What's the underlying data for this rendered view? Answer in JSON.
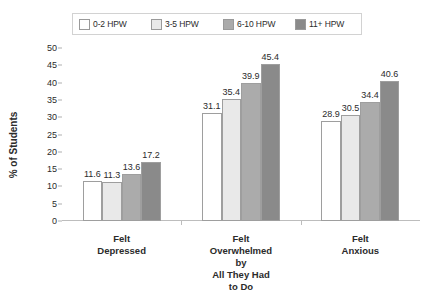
{
  "chart_data": {
    "type": "bar",
    "title": "",
    "xlabel": "",
    "ylabel": "% of Students",
    "ylim": [
      0,
      50
    ],
    "yticks": [
      0,
      5,
      10,
      15,
      20,
      25,
      30,
      35,
      40,
      45,
      50
    ],
    "grid": false,
    "legend_position": "top",
    "categories": [
      "Felt Depressed",
      "Felt Overwhelmed by\nAll They Had to Do",
      "Felt Anxious"
    ],
    "series": [
      {
        "name": "0-2 HPW",
        "color": "#ffffff",
        "values": [
          11.6,
          31.1,
          28.9
        ]
      },
      {
        "name": "3-5 HPW",
        "color": "#e9e9e9",
        "values": [
          11.3,
          35.4,
          30.5
        ]
      },
      {
        "name": "6-10 HPW",
        "color": "#ababab",
        "values": [
          13.6,
          39.9,
          34.4
        ]
      },
      {
        "name": "11+ HPW",
        "color": "#8a8a8a",
        "values": [
          17.2,
          45.4,
          40.6
        ]
      }
    ],
    "value_labels": [
      [
        "11.6",
        "11.3",
        "13.6",
        "17.2"
      ],
      [
        "31.1",
        "35.4",
        "39.9",
        "45.4"
      ],
      [
        "28.9",
        "30.5",
        "34.4",
        "40.6"
      ]
    ]
  }
}
